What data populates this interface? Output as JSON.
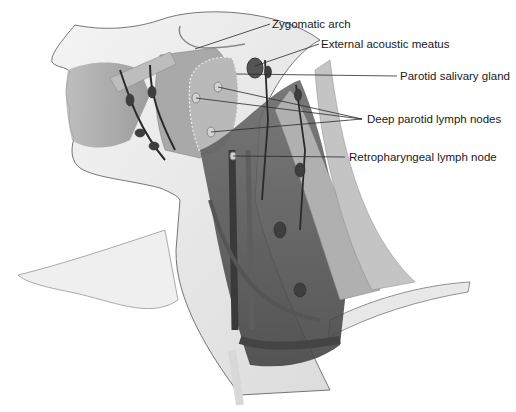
{
  "figure": {
    "colors": {
      "background": "#ffffff",
      "tissue_light": "#d9d9d9",
      "tissue_mid": "#9a9a9a",
      "tissue_dark": "#4a4a4a",
      "leader": "#2a2a2a",
      "text": "#1a1a1a"
    },
    "labels": [
      {
        "id": "zygomatic-arch",
        "text": "Zygomatic arch",
        "x": 272,
        "y": 19,
        "targets": [
          [
            195,
            49
          ]
        ]
      },
      {
        "id": "external-acoustic-meatus",
        "text": "External acoustic meatus",
        "x": 321,
        "y": 40,
        "targets": [
          [
            255,
            66
          ]
        ]
      },
      {
        "id": "parotid-salivary-gland",
        "text": "Parotid salivary gland",
        "x": 400,
        "y": 71,
        "targets": [
          [
            236,
            74
          ]
        ]
      },
      {
        "id": "deep-parotid-lymph-nodes",
        "text": "Deep parotid lymph nodes",
        "x": 367,
        "y": 114,
        "targets": [
          [
            218,
            87
          ],
          [
            196,
            98
          ],
          [
            211,
            132
          ]
        ]
      },
      {
        "id": "retropharyngeal-lymph-node",
        "text": "Retropharyngeal lymph node",
        "x": 349,
        "y": 152,
        "targets": [
          [
            233,
            156
          ]
        ]
      }
    ]
  }
}
